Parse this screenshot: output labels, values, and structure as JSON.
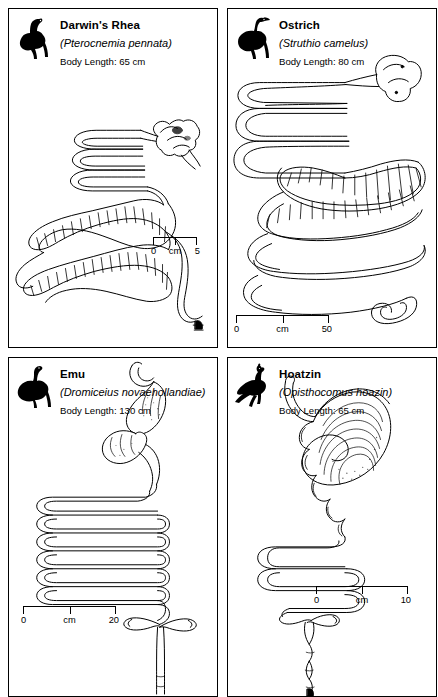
{
  "figure": {
    "type": "anatomical-plate",
    "panel_count": 4
  },
  "panels": [
    {
      "id": "darwins-rhea",
      "common_name": "Darwin's Rhea",
      "scientific_name": "(Pterocnemia pennata)",
      "body_length_label": "Body Length: 65 cm",
      "silhouette_icon": "rhea-silhouette-icon",
      "diagram_icon": "digestive-tract-diagram",
      "scale": {
        "zero": "0",
        "unit": "cm",
        "max": "5"
      }
    },
    {
      "id": "ostrich",
      "common_name": "Ostrich",
      "scientific_name": "(Struthio camelus)",
      "body_length_label": "Body Length: 80 cm",
      "silhouette_icon": "ostrich-silhouette-icon",
      "diagram_icon": "digestive-tract-diagram",
      "scale": {
        "zero": "0",
        "unit": "cm",
        "max": "50"
      }
    },
    {
      "id": "emu",
      "common_name": "Emu",
      "scientific_name": "(Dromiceius novaehollandiae)",
      "body_length_label": "Body Length: 130 cm",
      "silhouette_icon": "emu-silhouette-icon",
      "diagram_icon": "digestive-tract-diagram",
      "scale": {
        "zero": "0",
        "unit": "cm",
        "max": "20"
      }
    },
    {
      "id": "hoatzin",
      "common_name": "Hoatzin",
      "scientific_name": "(Opisthocomus hoazin)",
      "body_length_label": "Body Length: 65 cm",
      "silhouette_icon": "hoatzin-silhouette-icon",
      "diagram_icon": "digestive-tract-diagram",
      "scale": {
        "zero": "0",
        "unit": "cm",
        "max": "10"
      }
    }
  ],
  "colors": {
    "ink": "#000000",
    "paper": "#ffffff"
  }
}
